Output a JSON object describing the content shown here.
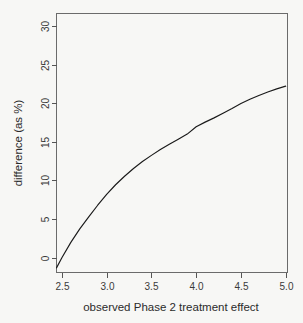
{
  "chart_data": {
    "type": "line",
    "title": "",
    "xlabel": "observed Phase 2 treatment effect",
    "ylabel": "difference (as %)",
    "xlim": [
      2.44,
      5.02
    ],
    "ylim": [
      -1.9,
      31.6
    ],
    "xticks": [
      2.5,
      3.0,
      3.5,
      4.0,
      4.5,
      5.0
    ],
    "xtick_labels": [
      "2.5",
      "3.0",
      "3.5",
      "4.0",
      "4.5",
      "5.0"
    ],
    "yticks": [
      0,
      5,
      10,
      15,
      20,
      25,
      30
    ],
    "ytick_labels": [
      "0",
      "5",
      "10",
      "15",
      "20",
      "25",
      "30"
    ],
    "grid": false,
    "legend": false,
    "line_color": "#1a1a1a",
    "background_color": "#f7f7f5",
    "frame_color": "#6b6b6b",
    "series": [
      {
        "name": "difference",
        "x": [
          2.44,
          2.5,
          2.6,
          2.7,
          2.8,
          2.9,
          3.0,
          3.1,
          3.2,
          3.3,
          3.4,
          3.5,
          3.6,
          3.7,
          3.8,
          3.9,
          4.0,
          4.1,
          4.2,
          4.3,
          4.4,
          4.5,
          4.6,
          4.7,
          4.8,
          4.9,
          5.0
        ],
        "y": [
          -1.3,
          0.0,
          2.0,
          3.75,
          5.3,
          6.8,
          8.2,
          9.45,
          10.55,
          11.55,
          12.45,
          13.25,
          14.0,
          14.7,
          15.35,
          16.0,
          16.95,
          17.55,
          18.1,
          18.7,
          19.3,
          19.95,
          20.5,
          21.0,
          21.45,
          21.85,
          22.2
        ]
      }
    ]
  },
  "labels": {
    "x_axis_title": "observed Phase 2 treatment effect",
    "y_axis_title": "difference (as %)"
  }
}
